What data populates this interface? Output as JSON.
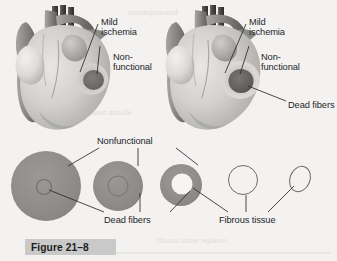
{
  "figure": {
    "caption": "Figure 21–8",
    "background_color": "#f3f2f0",
    "caption_band_color": "#c9c9c9",
    "ink_color": "#25262a"
  },
  "hearts": [
    {
      "id": "heart-left",
      "labels": [
        {
          "name": "mild-ischemia",
          "text": "Mild\nischemia"
        },
        {
          "name": "nonfunctional",
          "text": "Non-\nfunctional"
        }
      ]
    },
    {
      "id": "heart-right",
      "labels": [
        {
          "name": "mild-ischemia",
          "text": "Mild\nischemia"
        },
        {
          "name": "nonfunctional",
          "text": "Non-\nfunctional"
        },
        {
          "name": "dead-fibers",
          "text": "Dead fibers"
        }
      ]
    }
  ],
  "cross_sections": {
    "labels": {
      "nonfunctional": "Nonfunctional",
      "dead_fibers": "Dead fibers",
      "fibrous_tissue": "Fibrous tissue"
    },
    "items": [
      {
        "name": "cross-section-1",
        "fill": "#8e8e8e",
        "core": "ring-small"
      },
      {
        "name": "cross-section-2",
        "fill": "#8e8e8e",
        "core": "ring-faint"
      },
      {
        "name": "cross-section-3",
        "fill": "#8e8e8e",
        "core": "white-hole"
      },
      {
        "name": "cross-section-4",
        "fill": "none",
        "core": "outline-circle"
      },
      {
        "name": "cross-section-5",
        "fill": "none",
        "core": "outline-oval"
      }
    ]
  },
  "bleed_text": {
    "line1": "    uncompensated                 the",
    "line2": "     ischemia of the heart muscle",
    "line3": "   fibrous tissue replaces"
  }
}
